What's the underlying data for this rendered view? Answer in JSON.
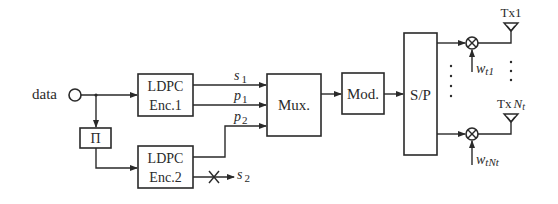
{
  "diagram": {
    "type": "block-diagram",
    "input": {
      "label": "data"
    },
    "interleaver": {
      "label": "Π"
    },
    "encoder1": {
      "line1": "LDPC",
      "line2": "Enc.1"
    },
    "encoder2": {
      "line1": "LDPC",
      "line2": "Enc.2"
    },
    "signals": {
      "s1": {
        "base": "s",
        "sub": "1"
      },
      "p1": {
        "base": "p",
        "sub": "1"
      },
      "p2": {
        "base": "p",
        "sub": "2"
      },
      "s2": {
        "base": "s",
        "sub": "2",
        "note": "punctured (crossed out)"
      }
    },
    "mux": {
      "label": "Mux."
    },
    "mod": {
      "label": "Mod."
    },
    "sp": {
      "label": "S/P"
    },
    "branches": [
      {
        "weight_base": "w",
        "weight_sub": "t1",
        "antenna_label": "Tx1",
        "antenna_base": "Tx",
        "antenna_sub": "1"
      },
      {
        "weight_base": "w",
        "weight_sub": "tNt",
        "antenna_label": "TxNt",
        "antenna_base": "Tx",
        "antenna_sub_N": "N",
        "antenna_sub_t": "t"
      }
    ],
    "colors": {
      "stroke": "#2a2a2a",
      "background": "#ffffff"
    }
  }
}
